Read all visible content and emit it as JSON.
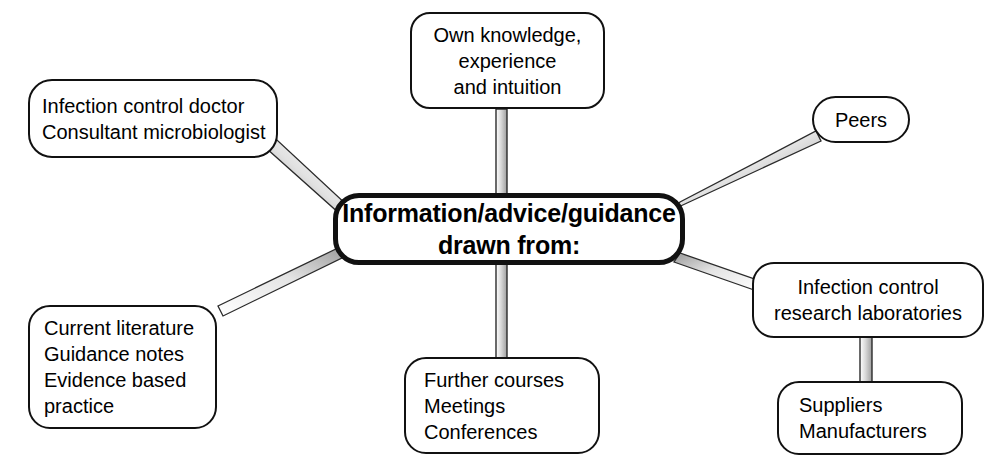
{
  "diagram": {
    "title": "Information/advice/guidance drawn from:",
    "background_color": "#ffffff",
    "line_color": "#111111",
    "connector_fill": "#c9c9c9",
    "central_node": {
      "id": "central",
      "lines": [
        "Information/advice/guidance",
        "drawn from:"
      ]
    },
    "nodes": [
      {
        "id": "own-knowledge",
        "lines": [
          "Own knowledge,",
          "experience",
          "and intuition"
        ],
        "align": "center"
      },
      {
        "id": "infection-doctor",
        "lines": [
          "Infection control doctor",
          "Consultant microbiologist"
        ],
        "align": "left"
      },
      {
        "id": "peers",
        "lines": [
          "Peers"
        ],
        "align": "center"
      },
      {
        "id": "research-labs",
        "lines": [
          "Infection control",
          "research laboratories"
        ],
        "align": "center"
      },
      {
        "id": "suppliers",
        "lines": [
          "Suppliers",
          "Manufacturers"
        ],
        "align": "left"
      },
      {
        "id": "courses",
        "lines": [
          "Further courses",
          "Meetings",
          "Conferences"
        ],
        "align": "left"
      },
      {
        "id": "literature",
        "lines": [
          "Current literature",
          "Guidance notes",
          "Evidence based",
          "practice"
        ],
        "align": "left"
      }
    ],
    "connectors": [
      {
        "id": "central-to-own-knowledge",
        "from": "central",
        "to": "own-knowledge"
      },
      {
        "id": "central-to-infection-doctor",
        "from": "central",
        "to": "infection-doctor"
      },
      {
        "id": "central-to-peers",
        "from": "central",
        "to": "peers"
      },
      {
        "id": "central-to-research-labs",
        "from": "central",
        "to": "research-labs"
      },
      {
        "id": "central-to-courses",
        "from": "central",
        "to": "courses"
      },
      {
        "id": "central-to-literature",
        "from": "central",
        "to": "literature"
      },
      {
        "id": "research-labs-to-suppliers",
        "from": "research-labs",
        "to": "suppliers"
      }
    ]
  }
}
